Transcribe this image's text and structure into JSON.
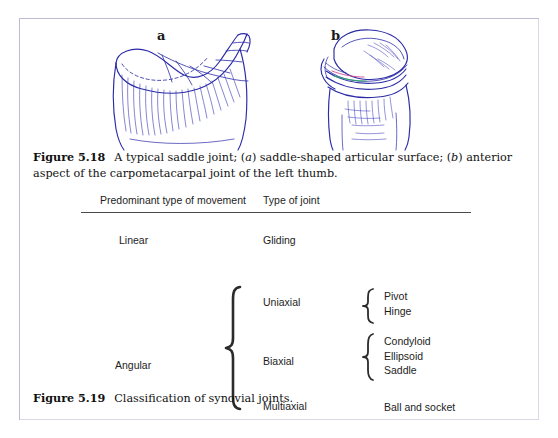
{
  "figure_518": {
    "panel_a_label": "a",
    "panel_b_label": "b",
    "caption_prefix": "Figure 5.18",
    "caption_part1": "A typical saddle joint; (",
    "caption_italic_a": "a",
    "caption_part2": ") saddle-shaped articular surface; (",
    "caption_italic_b": "b",
    "caption_part3": ") anterior aspect of the carpometacarpal joint of the left thumb."
  },
  "figure_519": {
    "caption_prefix": "Figure 5.19",
    "caption_text": "Classification of synovial joints."
  },
  "table": {
    "headers": {
      "movement": "Predominant type of movement",
      "joint": "Type of joint"
    },
    "rows": {
      "linear": "Linear",
      "angular": "Angular",
      "gliding": "Gliding",
      "uniaxial": "Uniaxial",
      "biaxial": "Biaxial",
      "multiaxial": "Multiaxial"
    },
    "joint_types": {
      "uniaxial": [
        "Pivot",
        "Hinge"
      ],
      "biaxial": [
        "Condyloid",
        "Ellipsoid",
        "Saddle"
      ],
      "multiaxial": [
        "Ball and socket"
      ]
    }
  },
  "colors": {
    "plate_border": "#bcbcd2",
    "line_art": "#2b2ba8",
    "rule": "#4a4a4a",
    "text": "#1d1d1d",
    "page_background": "#ffffff"
  }
}
